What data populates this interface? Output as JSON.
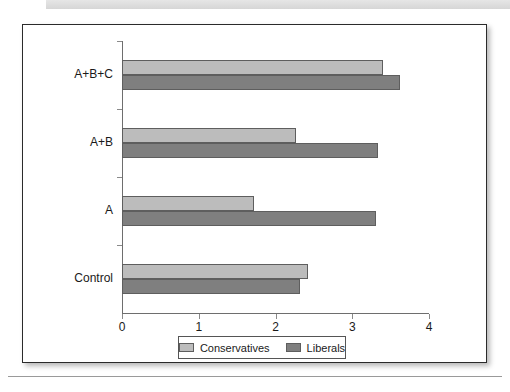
{
  "chart_data": {
    "type": "bar",
    "orientation": "horizontal",
    "title": "",
    "xlabel": "",
    "ylabel": "",
    "categories": [
      "A+B+C",
      "A+B",
      "A",
      "Control"
    ],
    "series": [
      {
        "name": "Conservatives",
        "color": "#bcbcbc",
        "values": [
          3.4,
          2.27,
          1.72,
          2.42
        ]
      },
      {
        "name": "Liberals",
        "color": "#7f7f7f",
        "values": [
          3.62,
          3.34,
          3.31,
          2.32
        ]
      }
    ],
    "xlim": [
      0,
      4
    ],
    "xticks": [
      "0",
      "1",
      "2",
      "3",
      "4"
    ],
    "grid": false,
    "legend_position": "bottom-center"
  },
  "legend": {
    "items": [
      {
        "label": "Conservatives"
      },
      {
        "label": "Liberals"
      }
    ]
  },
  "page": {
    "caption": ""
  }
}
